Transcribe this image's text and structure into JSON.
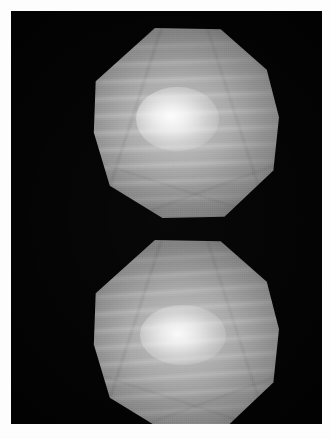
{
  "figure": {
    "kind": "scientific-image",
    "width_px": 330,
    "height_px": 439,
    "page_background": "#fdfdfd",
    "border_margin_px": 11,
    "caption": "",
    "title": "",
    "alt_text": "Two octagonal bright apertures stacked vertically on a black background, each showing horizontal interference fringes with a bright central hot-spot."
  },
  "panel": {
    "name": "black imaging field",
    "background_color": "#000000",
    "left_px": 11,
    "top_px": 11,
    "width_px": 311,
    "height_px": 413
  },
  "apertures": [
    {
      "id": "upper",
      "label": "upper octagon",
      "shape": "octagon",
      "sides": 8,
      "left_px": 80,
      "top_px": 17,
      "width_px": 188,
      "height_px": 190,
      "center_x_px": 174,
      "center_y_px": 112,
      "body_color": "#878787",
      "rim_color": "#707070",
      "core_color": "#ffffff",
      "hotspot_center_x_px": 157,
      "hotspot_center_y_px": 110,
      "fringe_orientation": "horizontal",
      "fringe_tilt_deg": -2,
      "fringe_count": 11,
      "fringe_spacing_px": 17,
      "peak_brightness": 255,
      "background_brightness": 0
    },
    {
      "id": "lower",
      "label": "lower octagon",
      "shape": "octagon",
      "sides": 8,
      "left_px": 80,
      "top_px": 229,
      "width_px": 188,
      "height_px": 190,
      "center_x_px": 174,
      "center_y_px": 324,
      "body_color": "#858585",
      "rim_color": "#6e6e6e",
      "core_color": "#ffffff",
      "hotspot_center_x_px": 160,
      "hotspot_center_y_px": 322,
      "fringe_orientation": "horizontal",
      "fringe_tilt_deg": -4,
      "fringe_count": 11,
      "fringe_spacing_px": 17,
      "peak_brightness": 250,
      "background_brightness": 0
    }
  ],
  "colors": {
    "field": "#000000",
    "page": "#fdfdfd",
    "aperture_mid_gray": "#9a9a9a",
    "aperture_dark_gray": "#6e6e6e",
    "aperture_highlight": "#ffffff"
  }
}
